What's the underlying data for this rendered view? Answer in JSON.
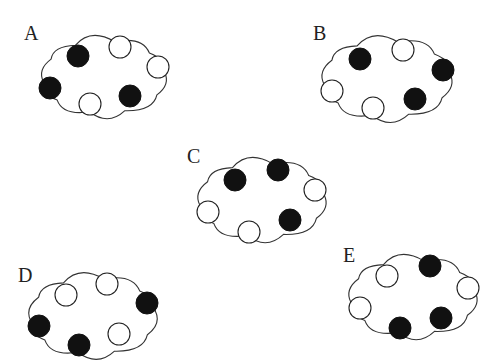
{
  "figure": {
    "colors": {
      "filled": "#111111",
      "open": "#ffffff",
      "outline": "#333333"
    },
    "dot_radius": 11,
    "clouds": [
      {
        "label": "A",
        "label_pos": [
          24,
          40
        ],
        "center": [
          104,
          77
        ],
        "size": [
          142,
          92
        ],
        "dots": [
          {
            "x": 78,
            "y": 56,
            "filled": true
          },
          {
            "x": 120,
            "y": 47,
            "filled": false
          },
          {
            "x": 158,
            "y": 67,
            "filled": false
          },
          {
            "x": 50,
            "y": 88,
            "filled": true
          },
          {
            "x": 90,
            "y": 104,
            "filled": false
          },
          {
            "x": 130,
            "y": 96,
            "filled": true
          }
        ]
      },
      {
        "label": "B",
        "label_pos": [
          313,
          40
        ],
        "center": [
          387,
          79
        ],
        "size": [
          148,
          96
        ],
        "dots": [
          {
            "x": 360,
            "y": 59,
            "filled": true
          },
          {
            "x": 403,
            "y": 50,
            "filled": false
          },
          {
            "x": 443,
            "y": 70,
            "filled": true
          },
          {
            "x": 332,
            "y": 91,
            "filled": false
          },
          {
            "x": 373,
            "y": 108,
            "filled": false
          },
          {
            "x": 415,
            "y": 99,
            "filled": true
          }
        ]
      },
      {
        "label": "C",
        "label_pos": [
          187,
          163
        ],
        "center": [
          262,
          200
        ],
        "size": [
          146,
          94
        ],
        "dots": [
          {
            "x": 235,
            "y": 180,
            "filled": true
          },
          {
            "x": 278,
            "y": 170,
            "filled": true
          },
          {
            "x": 315,
            "y": 190,
            "filled": false
          },
          {
            "x": 208,
            "y": 212,
            "filled": false
          },
          {
            "x": 249,
            "y": 232,
            "filled": false
          },
          {
            "x": 290,
            "y": 220,
            "filled": true
          }
        ]
      },
      {
        "label": "D",
        "label_pos": [
          18,
          282
        ],
        "center": [
          93,
          316
        ],
        "size": [
          146,
          96
        ],
        "dots": [
          {
            "x": 66,
            "y": 295,
            "filled": false
          },
          {
            "x": 107,
            "y": 284,
            "filled": false
          },
          {
            "x": 147,
            "y": 303,
            "filled": true
          },
          {
            "x": 39,
            "y": 326,
            "filled": true
          },
          {
            "x": 79,
            "y": 345,
            "filled": true
          },
          {
            "x": 119,
            "y": 334,
            "filled": false
          }
        ]
      },
      {
        "label": "E",
        "label_pos": [
          343,
          262
        ],
        "center": [
          413,
          297
        ],
        "size": [
          146,
          94
        ],
        "dots": [
          {
            "x": 387,
            "y": 276,
            "filled": false
          },
          {
            "x": 430,
            "y": 266,
            "filled": true
          },
          {
            "x": 468,
            "y": 288,
            "filled": false
          },
          {
            "x": 360,
            "y": 308,
            "filled": false
          },
          {
            "x": 400,
            "y": 328,
            "filled": true
          },
          {
            "x": 441,
            "y": 318,
            "filled": true
          }
        ]
      }
    ]
  }
}
